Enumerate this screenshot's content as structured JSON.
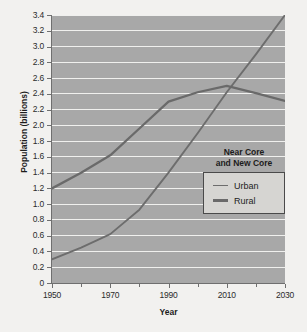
{
  "chart_data": {
    "type": "line",
    "title": "",
    "xlabel": "Year",
    "ylabel": "Population (billions)",
    "xlim": [
      1950,
      2030
    ],
    "ylim": [
      0,
      3.4
    ],
    "grid": true,
    "legend_position": "inside-right",
    "legend_title": [
      "Near Core",
      "and New Core"
    ],
    "x_ticks_major": [
      "1950",
      "1970",
      "1990",
      "2010",
      "2030"
    ],
    "x_ticks_major_values": [
      1950,
      1970,
      1990,
      2010,
      2030
    ],
    "x_ticks_minor_values": [
      1960,
      1980,
      2000,
      2020
    ],
    "y_ticks": [
      "0",
      "0.2",
      "0.4",
      "0.6",
      "0.8",
      "1.0",
      "1.2",
      "1.4",
      "1.6",
      "1.8",
      "2.0",
      "2.2",
      "2.4",
      "2.6",
      "2.8",
      "3.0",
      "3.2",
      "3.4"
    ],
    "y_tick_values": [
      0,
      0.2,
      0.4,
      0.6,
      0.8,
      1.0,
      1.2,
      1.4,
      1.6,
      1.8,
      2.0,
      2.2,
      2.4,
      2.6,
      2.8,
      3.0,
      3.2,
      3.4
    ],
    "x": [
      1950,
      1960,
      1970,
      1980,
      1990,
      2000,
      2010,
      2020,
      2030
    ],
    "series": [
      {
        "name": "Urban",
        "color": "#6d6d6d",
        "values": [
          0.3,
          0.45,
          0.62,
          0.93,
          1.4,
          1.9,
          2.42,
          2.9,
          3.4
        ]
      },
      {
        "name": "Rural",
        "color": "#6a6a6a",
        "values": [
          1.2,
          1.4,
          1.62,
          1.96,
          2.3,
          2.42,
          2.5,
          2.41,
          2.31
        ]
      }
    ]
  },
  "colors": {
    "page_background": "#f2f1ef",
    "plot_background": "#a8a8a8",
    "gridline": "#f0f0ee",
    "axis": "#6f6f6f",
    "text": "#1c1c1c",
    "legend_background": "#d6d5d2",
    "legend_border": "#4a4a4a"
  }
}
